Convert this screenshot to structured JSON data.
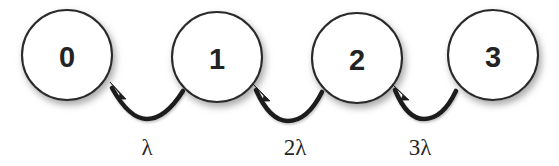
{
  "diagram": {
    "type": "state-transition-diagram",
    "background_color": "#ffffff",
    "node_fill_color": "#ffffff",
    "node_stroke_color": "#2b2b2b",
    "arrow_color": "#1d1d1d",
    "text_color": "#232323",
    "states": [
      {
        "label": "0",
        "cx": 67,
        "cy": 55,
        "r": 45
      },
      {
        "label": "1",
        "cx": 217,
        "cy": 57,
        "r": 45
      },
      {
        "label": "2",
        "cx": 357,
        "cy": 58,
        "r": 45
      },
      {
        "label": "3",
        "cx": 493,
        "cy": 55,
        "r": 45
      }
    ],
    "transitions": [
      {
        "label": "λ",
        "from_state": "1",
        "to_state": "0",
        "label_x": 147,
        "label_y": 155,
        "arc_path": "M 183,91 C 171,110 160,119 147,119 C 133,119 122,106 112,88",
        "arrowhead_points": "110,82 126,99 118,99 120,94"
      },
      {
        "label": "2λ",
        "from_state": "2",
        "to_state": "1",
        "label_x": 295,
        "label_y": 155,
        "arc_path": "M 322,92 C 312,112 300,121 288,121 C 275,121 264,108 256,90",
        "arrowhead_points": "253,84 270,101 262,101 264,96"
      },
      {
        "label": "3λ",
        "from_state": "3",
        "to_state": "2",
        "label_x": 420,
        "label_y": 155,
        "arc_path": "M 456,91 C 447,110 436,119 424,119 C 412,119 402,107 395,90",
        "arrowhead_points": "392,84 409,100 401,100 403,95"
      }
    ]
  }
}
